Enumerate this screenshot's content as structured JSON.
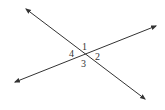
{
  "diagram": {
    "line_color": "#333333",
    "lines": [
      {
        "name": "line-a",
        "x1": 26,
        "y1": 9,
        "x2": 145,
        "y2": 99
      },
      {
        "name": "line-b",
        "x1": 15,
        "y1": 82,
        "x2": 156,
        "y2": 26
      }
    ],
    "intersection": {
      "x": 85,
      "y": 54
    },
    "angle_labels": [
      {
        "text": "1",
        "x": 82,
        "y": 50
      },
      {
        "text": "2",
        "x": 95,
        "y": 59
      },
      {
        "text": "3",
        "x": 82,
        "y": 66
      },
      {
        "text": "4",
        "x": 69,
        "y": 56
      }
    ]
  }
}
